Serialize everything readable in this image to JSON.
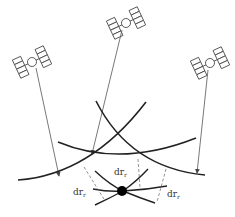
{
  "diagram": {
    "colors": {
      "line": "#222222",
      "signal": "#555555",
      "dashed": "#777777",
      "receiver": "#000000",
      "background": "#ffffff"
    },
    "satellites": [
      {
        "id": "sat-left",
        "x": 33,
        "y": 62
      },
      {
        "id": "sat-center",
        "x": 126,
        "y": 22
      },
      {
        "id": "sat-right",
        "x": 210,
        "y": 63
      }
    ],
    "labels": [
      {
        "id": "dr-top",
        "base": "dr",
        "sub": "r",
        "x": 116,
        "y": 170
      },
      {
        "id": "dr-left",
        "base": "dr",
        "sub": "r",
        "x": 75,
        "y": 190
      },
      {
        "id": "dr-right",
        "base": "dr",
        "sub": "r",
        "x": 168,
        "y": 190
      }
    ],
    "receiver": {
      "label": "receiver",
      "x": 122,
      "y": 191
    }
  }
}
